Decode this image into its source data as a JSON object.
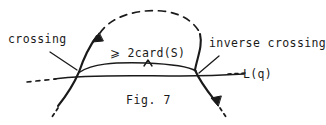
{
  "figure": {
    "caption": "Fig. 7",
    "labels": {
      "left_crossing": "crossing",
      "right_crossing": "inverse crossing",
      "cardinality_bound": "⩾ 2card(S)",
      "line_name": "L(q)"
    },
    "colors": {
      "ink": "#1a1a1a",
      "background": "#ffffff"
    }
  }
}
